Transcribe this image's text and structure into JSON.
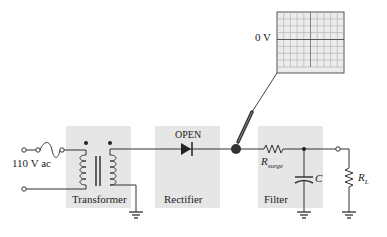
{
  "diagram": {
    "source_label": "110 V ac",
    "blocks": [
      {
        "id": "transformer",
        "label": "Transformer"
      },
      {
        "id": "rectifier",
        "label": "Rectifier",
        "fault": "OPEN"
      },
      {
        "id": "filter",
        "label": "Filter"
      }
    ],
    "components": {
      "surge_resistor": {
        "symbol": "R",
        "subscript": "surge"
      },
      "capacitor": {
        "symbol": "C"
      },
      "load_resistor": {
        "symbol": "R",
        "subscript": "L"
      }
    },
    "oscilloscope": {
      "reading_label": "0 V",
      "trace": "flat line at 0 V"
    },
    "colors": {
      "block_fill": "#e6e6e6",
      "wire": "#333333",
      "grid": "#9a9a9a",
      "screen": "#ececec"
    }
  }
}
